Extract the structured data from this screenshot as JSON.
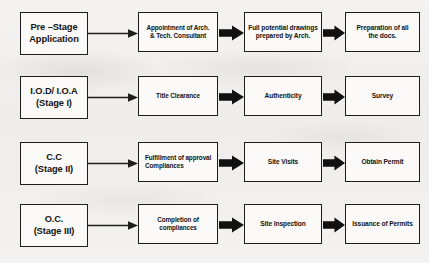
{
  "diagram": {
    "stroke_color": "#1d1d1d",
    "arrow_fill": "#111111",
    "node_fill": "#fbfaf8",
    "background": "#f2f1ef",
    "rows": [
      {
        "id": "row-pre-stage",
        "stage": "Pre –Stage\nApplication",
        "stage_lines": [
          "Pre –Stage",
          "Application"
        ],
        "steps": [
          {
            "label": "Appointment of Arch. & Tech. Consultant",
            "lines": [
              "Appointment of Arch.",
              "& Tech. Consultant"
            ],
            "align": "center"
          },
          {
            "label": "Full potential drawings prepared by Arch.",
            "lines": [
              "Full potential drawings",
              "prepared by Arch."
            ],
            "align": "center"
          },
          {
            "label": "Preparation of all the docs.",
            "lines": [
              "Preparation of all",
              "the docs."
            ],
            "align": "center"
          }
        ]
      },
      {
        "id": "row-iod-ioa",
        "stage": "I.O.D/ I.O.A\n(Stage I)",
        "stage_lines": [
          "I.O.D/ I.O.A",
          "(Stage I)"
        ],
        "steps": [
          {
            "label": "Title Clearance",
            "lines": [
              "Title Clearance"
            ],
            "align": "center"
          },
          {
            "label": "Authenticity",
            "lines": [
              "Authenticity"
            ],
            "align": "center"
          },
          {
            "label": "Survey",
            "lines": [
              "Survey"
            ],
            "align": "center"
          }
        ]
      },
      {
        "id": "row-cc",
        "stage": "C.C\n(Stage II)",
        "stage_lines": [
          "C.C",
          "(Stage II)"
        ],
        "steps": [
          {
            "label": "Fulfillment of approval Compliances",
            "lines": [
              "Fulfillment of approval",
              "Compliances"
            ],
            "align": "left"
          },
          {
            "label": "Site Visits",
            "lines": [
              "Site Visits"
            ],
            "align": "center"
          },
          {
            "label": "Obtain Permit",
            "lines": [
              "Obtain Permit"
            ],
            "align": "center"
          }
        ]
      },
      {
        "id": "row-oc",
        "stage": "O.C.\n(Stage III)",
        "stage_lines": [
          "O.C.",
          "(Stage III)"
        ],
        "steps": [
          {
            "label": "Completion of compliances",
            "lines": [
              "Completion of",
              "compliances"
            ],
            "align": "center"
          },
          {
            "label": "Site Inspection",
            "lines": [
              "Site Inspection"
            ],
            "align": "center"
          },
          {
            "label": "Issuance of Permits",
            "lines": [
              "Issuance of Permits"
            ],
            "align": "center"
          }
        ]
      }
    ],
    "connectors": {
      "stage_to_step1": "thin-line-arrow-right",
      "step1_to_step2": "thick-block-arrow-right",
      "step2_to_step3": "thick-block-arrow-right"
    }
  }
}
